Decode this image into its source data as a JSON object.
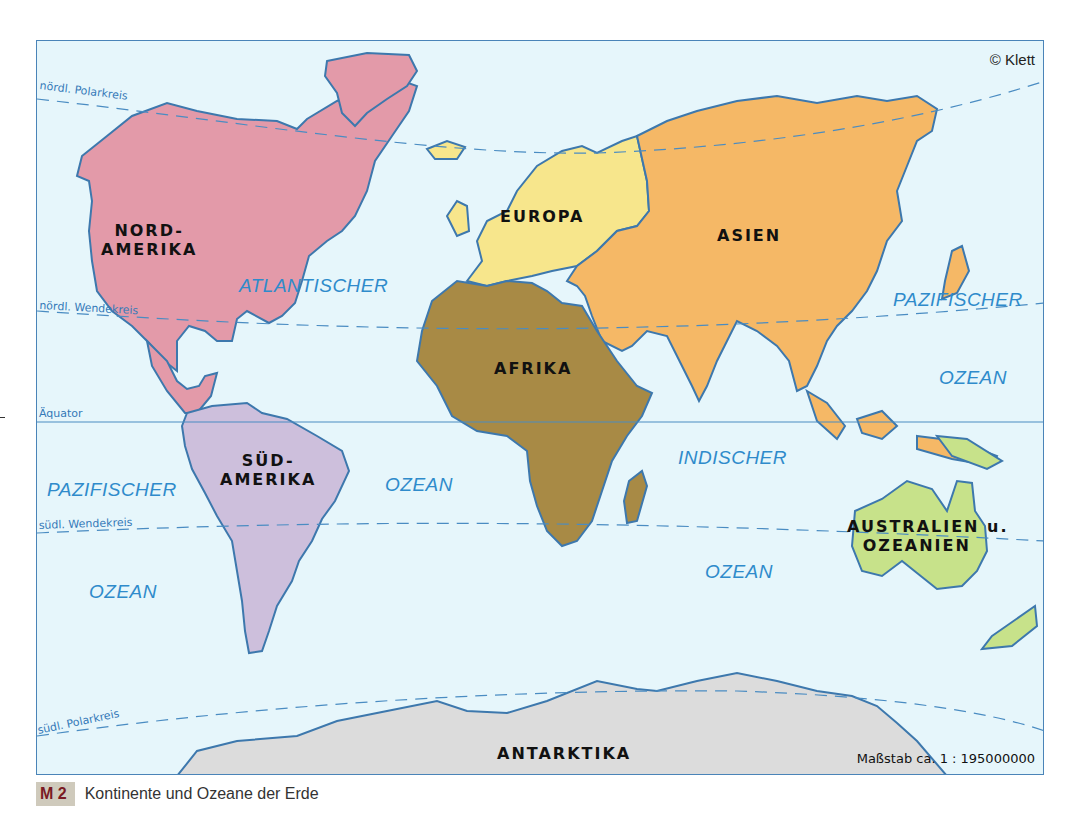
{
  "map": {
    "copyright": "© Klett",
    "scale": "Maßstab ca. 1 : 195000000",
    "lines": {
      "arctic_circle": "nördl. Polarkreis",
      "tropic_cancer": "nördl. Wendekreis",
      "equator": "Äquator",
      "tropic_capricorn": "südl. Wendekreis",
      "antarctic_circle": "südl. Polarkreis"
    },
    "continents": {
      "north_america": [
        "NORD-",
        "AMERIKA"
      ],
      "south_america": [
        "SÜD-",
        "AMERIKA"
      ],
      "europe": "EUROPA",
      "asia": "ASIEN",
      "africa": "AFRIKA",
      "australia": [
        "AUSTRALIEN u.",
        "OZEANIEN"
      ],
      "antarctica": "ANTARKTIKA"
    },
    "oceans": {
      "atlantic_1": "ATLANTISCHER",
      "atlantic_2": "OZEAN",
      "pacific_west_1": "PAZIFISCHER",
      "pacific_west_2": "OZEAN",
      "pacific_east_1": "PAZIFISCHER",
      "pacific_east_2": "OZEAN",
      "indian_1": "INDISCHER",
      "indian_2": "OZEAN"
    },
    "colors": {
      "ocean": "#e6f6fb",
      "coast": "#3d78ad",
      "north_america": "#e39aa9",
      "south_america": "#cdbfdc",
      "europe": "#f7e68c",
      "asia": "#f5b866",
      "africa": "#a88a45",
      "australia": "#c7e28a",
      "antarctica": "#dcdcdc"
    }
  },
  "caption": {
    "tag": "M 2",
    "text": "Kontinente und Ozeane der Erde"
  }
}
